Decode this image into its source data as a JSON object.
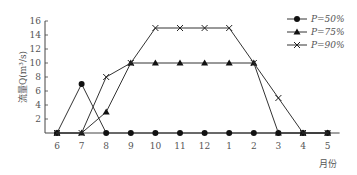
{
  "chart_data": {
    "type": "line",
    "title": "",
    "xlabel": "月份",
    "ylabel": "流量Q(m³/s)",
    "x": [
      "6",
      "7",
      "8",
      "9",
      "10",
      "11",
      "12",
      "1",
      "2",
      "3",
      "4",
      "5"
    ],
    "yticks": [
      2,
      4,
      6,
      8,
      10,
      12,
      14,
      16
    ],
    "ylim": [
      0,
      16
    ],
    "grid": false,
    "legend_position": "top-right",
    "series": [
      {
        "name": "P=50%",
        "marker": "circle",
        "values": [
          0,
          7,
          0,
          0,
          0,
          0,
          0,
          0,
          0,
          0,
          0,
          0
        ]
      },
      {
        "name": "P=75%",
        "marker": "triangle",
        "values": [
          0,
          0,
          3,
          10,
          10,
          10,
          10,
          10,
          10,
          0,
          0,
          0
        ]
      },
      {
        "name": "P=90%",
        "marker": "x",
        "values": [
          0,
          0,
          8,
          10,
          15,
          15,
          15,
          15,
          10,
          5,
          0,
          0
        ]
      }
    ]
  },
  "legend": [
    "P=50%",
    "P=75%",
    "P=90%"
  ]
}
